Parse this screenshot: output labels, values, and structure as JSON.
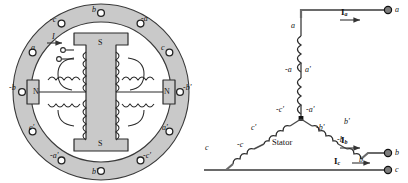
{
  "figure": {
    "type": "machine-cross-section-and-wye-winding-schematic",
    "colors": {
      "iron_fill": "#c9c9c9",
      "iron_stroke": "#2b2b2b",
      "line": "#3a3a3a",
      "slot_fill": "#ffffff",
      "text": "#111111"
    }
  },
  "left_diagram": {
    "name": "four-pole-machine-cross-section",
    "rotor_poles": [
      {
        "position": "top",
        "label": "S"
      },
      {
        "position": "left",
        "label": "N"
      },
      {
        "position": "right",
        "label": "N"
      },
      {
        "position": "bottom",
        "label": "S"
      }
    ],
    "field_current_label": "I",
    "stator_slot_labels": [
      {
        "index": 1,
        "label": "b",
        "angle_deg": -90
      },
      {
        "index": 2,
        "label": "-a",
        "angle_deg": -60
      },
      {
        "index": 3,
        "label": "c",
        "angle_deg": -30
      },
      {
        "index": 4,
        "label": "-b'",
        "angle_deg": 0
      },
      {
        "index": 5,
        "label": "a'",
        "angle_deg": 30
      },
      {
        "index": 6,
        "label": "-c'",
        "angle_deg": 60
      },
      {
        "index": 7,
        "label": "b'",
        "angle_deg": 90
      },
      {
        "index": 8,
        "label": "-a'",
        "angle_deg": 120
      },
      {
        "index": 9,
        "label": "c'",
        "angle_deg": 150
      },
      {
        "index": 10,
        "label": "-b",
        "angle_deg": 180
      },
      {
        "index": 11,
        "label": "a",
        "angle_deg": 210
      },
      {
        "index": 12,
        "label": "-c",
        "angle_deg": 240
      }
    ],
    "slot_count": 12
  },
  "right_diagram": {
    "name": "wye-connected-stator-winding",
    "center_label": "Stator",
    "phase_a": {
      "terminal_label": "a",
      "current_label": "I",
      "current_sub": "a",
      "coil_labels": [
        "a",
        "-a",
        "a'",
        "-a'"
      ]
    },
    "phase_b": {
      "terminal_label": "b",
      "current_label": "I",
      "current_sub": "b",
      "coil_labels": [
        "-b'",
        "b'",
        "-b",
        "b"
      ]
    },
    "phase_c": {
      "terminal_label": "c",
      "current_label": "I",
      "current_sub": "c",
      "coil_labels": [
        "-c'",
        "c'",
        "-c",
        "c"
      ]
    },
    "neutral_node": true
  }
}
